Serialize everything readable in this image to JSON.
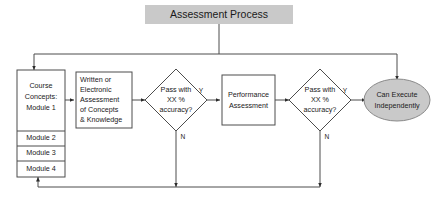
{
  "diagram": {
    "title": "Assessment Process",
    "colors": {
      "title_fill": "#c9c9c9",
      "terminal_fill": "#c9c9c9",
      "box_fill": "#ffffff",
      "stroke": "#4d4d4d",
      "text": "#1a1a1a"
    },
    "nodes": {
      "title_box": {
        "shape": "rectangle",
        "label": "Assessment Process"
      },
      "course_concepts": {
        "shape": "rectangle-stack",
        "rows": [
          {
            "lines": [
              "Course",
              "Concepts:",
              "Module 1"
            ]
          },
          {
            "lines": [
              "Module 2"
            ]
          },
          {
            "lines": [
              "Module 3"
            ]
          },
          {
            "lines": [
              "Module 4"
            ]
          }
        ]
      },
      "written_assessment": {
        "shape": "rectangle",
        "lines": [
          "Written or",
          "Electronic",
          "Assessment",
          "of Concepts",
          "& Knowledge"
        ]
      },
      "decision_one": {
        "shape": "diamond",
        "lines": [
          "Pass with",
          "XX %",
          "accuracy?"
        ],
        "yes_label": "Y",
        "no_label": "N"
      },
      "performance_assessment": {
        "shape": "rectangle",
        "lines": [
          "Performance",
          "Assessment"
        ]
      },
      "decision_two": {
        "shape": "diamond",
        "lines": [
          "Pass with",
          "XX %",
          "accuracy?"
        ],
        "yes_label": "Y",
        "no_label": "N"
      },
      "outcome": {
        "shape": "ellipse",
        "lines": [
          "Can Execute",
          "Independently"
        ]
      }
    }
  }
}
